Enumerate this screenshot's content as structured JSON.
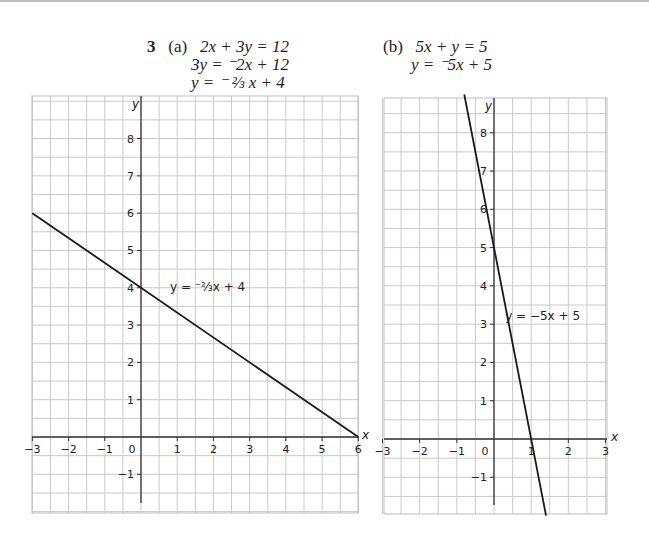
{
  "question": {
    "number": "3",
    "part_a": {
      "label": "(a)",
      "lines": [
        "2x + 3y = 12",
        "3y = ⁻2x + 12",
        "y = ⁻ ⅔ x + 4"
      ]
    },
    "part_b": {
      "label": "(b)",
      "lines": [
        "5x + y = 5",
        "y = ⁻5x + 5"
      ]
    }
  },
  "chart_data": [
    {
      "type": "line",
      "title": "(a)",
      "xlabel": "x",
      "ylabel": "y",
      "xlim": [
        -3,
        6
      ],
      "ylim": [
        -2,
        9
      ],
      "grid": true,
      "grid_step": 0.5,
      "x_ticks": [
        -3,
        -2,
        -1,
        0,
        1,
        2,
        3,
        4,
        5,
        6
      ],
      "x_tick_labels": [
        "−3",
        "−2",
        "−1",
        "0",
        "1",
        "2",
        "3",
        "4",
        "5",
        "6"
      ],
      "y_ticks": [
        -1,
        1,
        2,
        3,
        4,
        5,
        6,
        7,
        8
      ],
      "y_tick_labels": [
        "−1",
        "1",
        "2",
        "3",
        "4",
        "5",
        "6",
        "7",
        "8"
      ],
      "series": [
        {
          "name": "y = −2/3 x + 4",
          "slope": -0.6667,
          "intercept": 4,
          "x": [
            -3,
            6
          ],
          "y": [
            6,
            0
          ]
        }
      ],
      "annotation": {
        "text": "y = ⁻⅔x + 4",
        "x": 0.8,
        "y": 3.9
      }
    },
    {
      "type": "line",
      "title": "(b)",
      "xlabel": "x",
      "ylabel": "y",
      "xlim": [
        -3,
        3
      ],
      "ylim": [
        -2,
        9
      ],
      "grid": true,
      "grid_step": 0.5,
      "x_ticks": [
        -3,
        -2,
        -1,
        0,
        1,
        2,
        3
      ],
      "x_tick_labels": [
        "−3",
        "−2",
        "−1",
        "0",
        "1",
        "2",
        "3"
      ],
      "y_ticks": [
        -1,
        1,
        2,
        3,
        4,
        5,
        6,
        7,
        8
      ],
      "y_tick_labels": [
        "−1",
        "1",
        "2",
        "3",
        "4",
        "5",
        "6",
        "7",
        "8"
      ],
      "series": [
        {
          "name": "y = −5x + 5",
          "slope": -5,
          "intercept": 5,
          "x": [
            -0.8,
            1.4
          ],
          "y": [
            9,
            -2
          ]
        }
      ],
      "annotation": {
        "text": "y = −5x + 5",
        "x": 0.3,
        "y": 3.1
      }
    }
  ]
}
